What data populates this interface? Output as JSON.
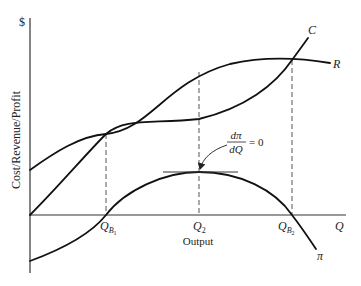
{
  "diagram": {
    "y_axis": {
      "unit_label": "$",
      "label": "Cost/Revenue/Profit"
    },
    "x_axis": {
      "label": "Output",
      "end_label": "Q"
    },
    "curves": [
      {
        "id": "C",
        "label": "C",
        "meaning": "total cost"
      },
      {
        "id": "R",
        "label": "R",
        "meaning": "total revenue"
      },
      {
        "id": "pi",
        "label": "π",
        "meaning": "profit"
      }
    ],
    "points": [
      {
        "label_main": "Q",
        "label_sub": "B",
        "label_subsub": "1",
        "meaning": "first break-even output"
      },
      {
        "label_main": "Q",
        "label_sub": "2",
        "meaning": "profit-maximising output"
      },
      {
        "label_main": "Q",
        "label_sub": "B",
        "label_subsub": "2",
        "meaning": "second break-even output"
      }
    ],
    "annotation": {
      "numerator": "dπ",
      "denominator": "dQ",
      "rhs": "= 0"
    },
    "colors": {
      "curve": "#111111",
      "axis": "#333333",
      "background": "#ffffff"
    }
  }
}
